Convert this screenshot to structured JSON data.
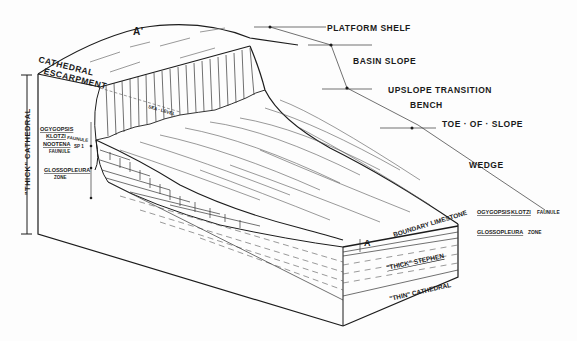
{
  "diagram": {
    "section_markers": {
      "top": "A'",
      "bottom": "A"
    },
    "profile_labels": [
      {
        "id": "platform-shelf",
        "text": "PLATFORM SHELF"
      },
      {
        "id": "basin-slope",
        "text": "BASIN SLOPE"
      },
      {
        "id": "upslope-transition",
        "text": "UPSLOPE TRANSITION"
      },
      {
        "id": "bench",
        "text": "BENCH"
      },
      {
        "id": "toe-of-slope",
        "text": "TOE · OF · SLOPE"
      },
      {
        "id": "wedge",
        "text": "WEDGE"
      }
    ],
    "escarpment_label": {
      "line1": "CATHEDRAL",
      "line2": "ESCARPMENT"
    },
    "sea_level": "SEA · LEVEL",
    "thick_cathedral": "\"THICK\" CATHEDRAL",
    "left_zones": [
      {
        "name": "OGYGOPSIS",
        "name2": "KLOTZI",
        "suffix": "FAUNULE"
      },
      {
        "name": "NOOTENA",
        "name2": "SP 1",
        "suffix": "FAUNULE"
      },
      {
        "name": "GLOSSOPLEURA",
        "name2": "",
        "suffix": "ZONE"
      }
    ],
    "right_zones": [
      {
        "name": "OGYGOPSIS",
        "name2": "KLOTZI",
        "suffix": "FAUNULE"
      },
      {
        "name": "GLOSSOPLEURA",
        "name2": "",
        "suffix": "ZONE"
      }
    ],
    "unit_labels": {
      "boundary_limestone": "BOUNDARY LIMESTONE",
      "thick_stephen": "\"THICK\" STEPHEN",
      "thin_cathedral": "\"THIN\" CATHEDRAL"
    }
  },
  "colors": {
    "ink": "#1c1c1c",
    "paper": "#fdfdfd"
  }
}
